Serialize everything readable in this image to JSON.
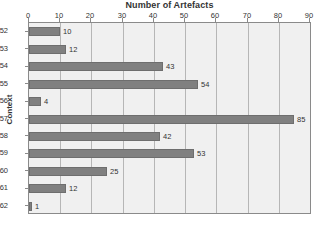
{
  "chart_data": {
    "type": "bar",
    "orientation": "horizontal",
    "title": "Number of Artefacts",
    "xlabel": "Number of Artefacts",
    "ylabel": "Context",
    "categories": [
      "152",
      "153",
      "154",
      "155",
      "156",
      "157",
      "158",
      "159",
      "160",
      "161",
      "162"
    ],
    "values": [
      10,
      12,
      43,
      54,
      4,
      85,
      42,
      53,
      25,
      12,
      1
    ],
    "value_labels": [
      "10",
      "12",
      "43",
      "54",
      "4",
      "85",
      "42",
      "53",
      "25",
      "12",
      "1"
    ],
    "xlim": [
      0,
      90
    ],
    "xticks": [
      0,
      10,
      20,
      30,
      40,
      50,
      60,
      70,
      80,
      90
    ],
    "xtick_labels": [
      "0",
      "10",
      "20",
      "30",
      "40",
      "50",
      "60",
      "70",
      "80",
      "90"
    ],
    "grid": "vertical",
    "legend": null,
    "colors": {
      "bar": "#808080",
      "bar_edge": "#6e6e6e",
      "plot_background": "#f0f0f0",
      "gridline": "#b6b6b6",
      "axis": "#8a8a8a",
      "text": "#333333",
      "page_background": "#ffffff"
    }
  }
}
